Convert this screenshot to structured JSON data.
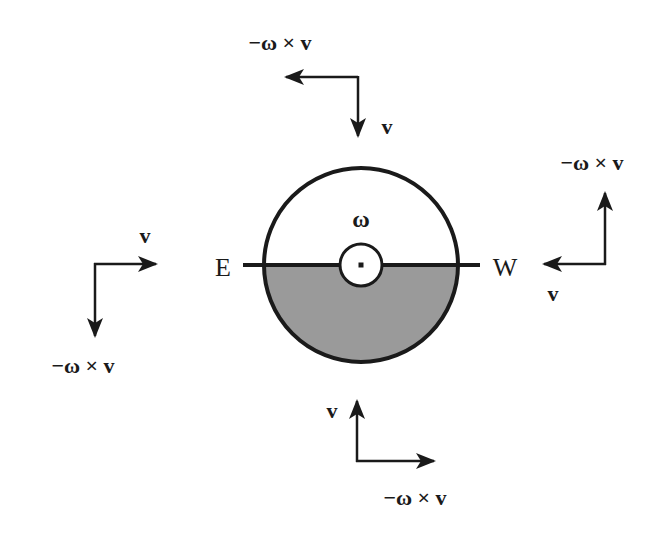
{
  "diagram": {
    "colors": {
      "stroke": "#1a1a1a",
      "shaded_half": "#9a9a9a",
      "background": "#ffffff"
    },
    "center_label": "ω",
    "compass": {
      "left": "E",
      "right": "W"
    },
    "arrow_pairs": [
      {
        "position": "top",
        "velocity_label": "v",
        "coriolis_label": "−ω × v",
        "velocity_direction": "down",
        "coriolis_direction": "left"
      },
      {
        "position": "left",
        "velocity_label": "v",
        "coriolis_label": "−ω × v",
        "velocity_direction": "right",
        "coriolis_direction": "down"
      },
      {
        "position": "right",
        "velocity_label": "v",
        "coriolis_label": "−ω × v",
        "velocity_direction": "left",
        "coriolis_direction": "up"
      },
      {
        "position": "bottom",
        "velocity_label": "v",
        "coriolis_label": "−ω × v",
        "velocity_direction": "up",
        "coriolis_direction": "right"
      }
    ]
  }
}
